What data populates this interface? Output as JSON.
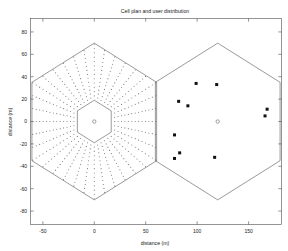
{
  "figure": {
    "title": "Cell plan and user distribution",
    "xlabel": "distance (m)",
    "ylabel": "distance (m)",
    "bg_color": "#ffffff",
    "frame_color": "#4d4d4d"
  },
  "chart_data": {
    "type": "scatter",
    "title": "Cell plan and user distribution",
    "xlabel": "distance (m)",
    "ylabel": "distance (m)",
    "xlim": [
      -62,
      182
    ],
    "ylim": [
      -92,
      92
    ],
    "xticks": [
      -50,
      0,
      50,
      100,
      150
    ],
    "xtick_labels": [
      "-50",
      "0",
      "50",
      "100",
      "150"
    ],
    "yticks": [
      80,
      60,
      40,
      20,
      0,
      -20,
      -40,
      -60,
      -80
    ],
    "ytick_labels": [
      "80",
      "60",
      "40",
      "20",
      "0",
      "-20",
      "-40",
      "-60",
      "-80"
    ],
    "grid": false,
    "legend": null,
    "cells": [
      {
        "name": "left-cell",
        "center": [
          0,
          0
        ],
        "radius": 70,
        "orientation": "pointy-top",
        "outline_color": "#555555",
        "content": "radial-dot-grid",
        "inner_hex_radius": 19,
        "grid_rings": 13,
        "grid_spokes": 36,
        "grid_dot_color": "#7a7a7a",
        "base_station_marker": "circle"
      },
      {
        "name": "right-cell",
        "center": [
          120,
          0
        ],
        "radius": 70,
        "orientation": "pointy-top",
        "outline_color": "#555555",
        "content": "user-scatter",
        "base_station_marker": "circle"
      }
    ],
    "series": [
      {
        "name": "users",
        "marker": "square",
        "color": "#111111",
        "points": [
          [
            99,
            34
          ],
          [
            119,
            33
          ],
          [
            82,
            18
          ],
          [
            91,
            14
          ],
          [
            168,
            11
          ],
          [
            166,
            5
          ],
          [
            78,
            -12
          ],
          [
            83,
            -28
          ],
          [
            78,
            -33
          ],
          [
            117,
            -32
          ],
          [
            120,
            0
          ]
        ]
      }
    ],
    "base_stations": [
      {
        "label": "left-cell-bs",
        "x": 0,
        "y": 0
      },
      {
        "label": "right-cell-bs",
        "x": 120,
        "y": 0
      }
    ]
  }
}
